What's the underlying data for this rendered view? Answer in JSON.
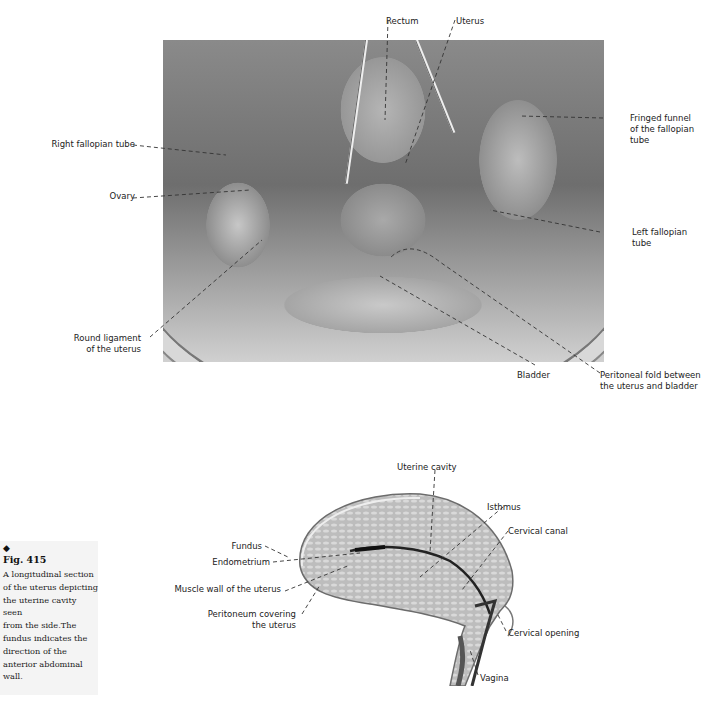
{
  "figure_top": {
    "labels": {
      "rectum": "Rectum",
      "uterus": "Uterus",
      "fringed_funnel_line1": "Fringed funnel",
      "fringed_funnel_line2": "of the fallopian",
      "fringed_funnel_line3": "tube",
      "right_fallopian_tube": "Right fallopian tube",
      "ovary": "Ovary",
      "left_fallopian_line1": "Left fallopian",
      "left_fallopian_line2": "tube",
      "round_ligament_line1": "Round ligament",
      "round_ligament_line2": "of the uterus",
      "bladder": "Bladder",
      "peritoneal_fold_line1": "Peritoneal fold between",
      "peritoneal_fold_line2": "the uterus and bladder"
    }
  },
  "figure_bottom": {
    "labels": {
      "uterine_cavity": "Uterine cavity",
      "isthmus": "Isthmus",
      "cervical_canal": "Cervical canal",
      "fundus": "Fundus",
      "endometrium": "Endometrium",
      "muscle_wall": "Muscle wall of the uterus",
      "peritoneum_line1": "Peritoneum covering",
      "peritoneum_line2": "the uterus",
      "cervical_opening": "Cervical opening",
      "vagina": "Vagina"
    }
  },
  "caption": {
    "marker": "◆",
    "figure_number": "Fig. 415",
    "text": "A longitudinal section\nof the uterus depicting\nthe uterine cavity seen\nfrom the side.The\nfundus indicates the\ndirection of the\nanterior abdominal\nwall."
  }
}
